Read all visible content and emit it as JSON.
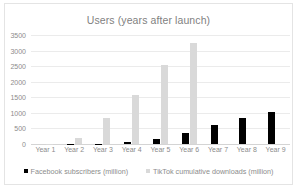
{
  "chart_data": {
    "type": "bar",
    "title": "Users (years after launch)",
    "xlabel": "",
    "ylabel": "",
    "ylim": [
      0,
      3500
    ],
    "ytick_step": 500,
    "yticks": [
      "0",
      "500",
      "1000",
      "1500",
      "2000",
      "2500",
      "3000",
      "3500"
    ],
    "grid": true,
    "legend_position": "bottom",
    "categories": [
      "Year 1",
      "Year 2",
      "Year 3",
      "Year 4",
      "Year 5",
      "Year 6",
      "Year 7",
      "Year 8",
      "Year 9"
    ],
    "series": [
      {
        "name": "Facebook subscribers (million)",
        "color": "#000000",
        "values": [
          1,
          6,
          12,
          58,
          150,
          360,
          620,
          850,
          1020
        ]
      },
      {
        "name": "TikTok cumulative downloads (million)",
        "color": "#d9d9d9",
        "values": [
          8,
          190,
          840,
          1580,
          2550,
          3250,
          0,
          0,
          0
        ]
      }
    ]
  },
  "legend": {
    "items": [
      {
        "label": "Facebook subscribers (million)",
        "swatch": "legend-swatch-facebook"
      },
      {
        "label": "TikTok cumulative downloads (million)",
        "swatch": "legend-swatch-tiktok"
      }
    ]
  },
  "colors": {
    "facebook": "#000000",
    "tiktok": "#d9d9d9",
    "grid": "#ebebeb",
    "text": "#8c8c8c",
    "frame": "#e4e4e4"
  }
}
